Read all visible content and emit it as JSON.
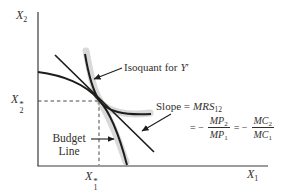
{
  "figure": {
    "axis": {
      "y": {
        "base": "X",
        "sub": "2"
      },
      "x": {
        "base": "X",
        "sub": "1"
      },
      "y_opt": {
        "base": "X",
        "sup": "*",
        "sub": "2"
      },
      "x_opt": {
        "base": "X",
        "sup": "*",
        "sub": "1"
      }
    },
    "isoquant_label": {
      "pre": "Isoquant for",
      "var": "Y",
      "prime": "′"
    },
    "slope_label": {
      "pre": "Slope =",
      "var": "MRS",
      "sub": "12"
    },
    "equation": {
      "eq1": "= −",
      "f1num": {
        "v": "MP",
        "s": "2"
      },
      "f1den": {
        "v": "MP",
        "s": "1"
      },
      "eq2": "= −",
      "f2num": {
        "v": "MC",
        "s": "2"
      },
      "f2den": {
        "v": "MC",
        "s": "1"
      }
    },
    "budget_label": {
      "line1": "Budget",
      "line2": "Line"
    },
    "colors": {
      "ink": "#1d1d1b",
      "band": "#d9d9d9",
      "text": "#32302c",
      "background": "#ffffff"
    }
  }
}
